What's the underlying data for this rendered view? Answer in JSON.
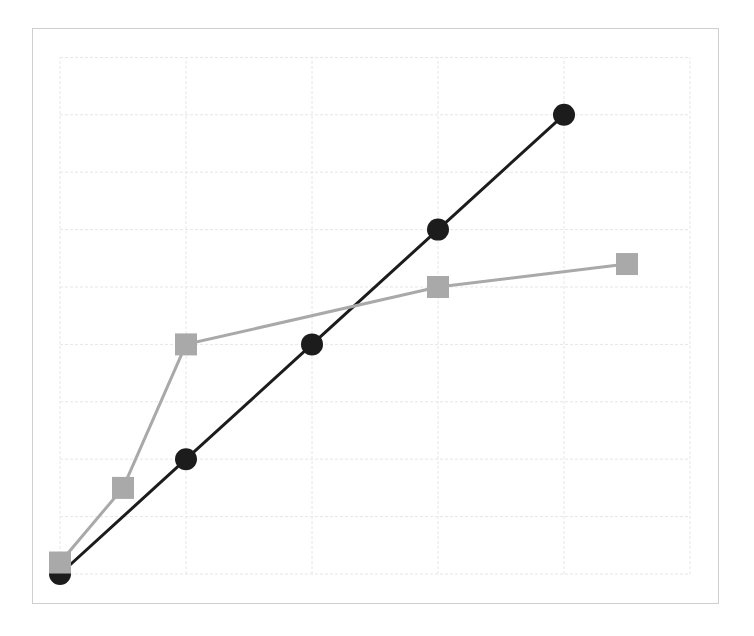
{
  "chart_data": {
    "type": "line",
    "title": "",
    "xlabel": "",
    "ylabel": "",
    "xlim": [
      0,
      5
    ],
    "ylim": [
      0,
      9
    ],
    "grid": true,
    "legend": null,
    "series": [
      {
        "name": "series-black-circles",
        "color": "#1c1c1c",
        "marker": "circle",
        "x": [
          0,
          1,
          2,
          3,
          4
        ],
        "y": [
          0,
          2,
          4,
          6,
          8
        ]
      },
      {
        "name": "series-gray-squares",
        "color": "#a9a9a9",
        "marker": "square",
        "x": [
          0,
          0.5,
          1,
          3,
          4.5
        ],
        "y": [
          0.2,
          1.5,
          4,
          5,
          5.4
        ]
      }
    ]
  },
  "layout": {
    "plot_left": 60,
    "plot_top": 57.4,
    "plot_width": 630,
    "plot_height": 516.6,
    "grid_color": "#e6e6e6",
    "frame_color": "#cfcfcf",
    "line_width": 3,
    "marker_size": 22
  }
}
